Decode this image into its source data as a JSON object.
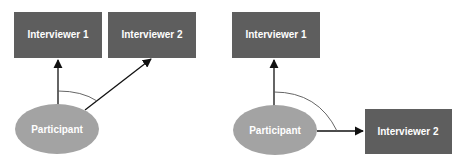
{
  "diagrams": [
    {
      "id": "left",
      "nodes": {
        "interviewer1": {
          "label": "Interviewer 1"
        },
        "interviewer2": {
          "label": "Interviewer 2"
        },
        "participant": {
          "label": "Participant"
        }
      },
      "edges": [
        {
          "from": "participant",
          "to": "interviewer1"
        },
        {
          "from": "participant",
          "to": "interviewer2"
        }
      ],
      "angle_marker": "acute angle between edges"
    },
    {
      "id": "right",
      "nodes": {
        "interviewer1": {
          "label": "Interviewer 1"
        },
        "interviewer2": {
          "label": "Interviewer 2"
        },
        "participant": {
          "label": "Participant"
        }
      },
      "edges": [
        {
          "from": "participant",
          "to": "interviewer1"
        },
        {
          "from": "participant",
          "to": "interviewer2"
        }
      ],
      "angle_marker": "right angle between edges"
    }
  ],
  "colors": {
    "box": "#5e5e5e",
    "ellipse": "#a3a3a3",
    "text": "#ffffff",
    "line": "#111111"
  }
}
